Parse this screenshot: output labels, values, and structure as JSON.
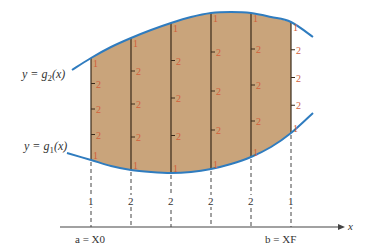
{
  "figure": {
    "colors": {
      "region_fill": "#c9a47b",
      "curve": "#2f7cbf",
      "weight_text": "#d2603a",
      "vertical_line": "#3a2a1a",
      "axis": "#444444",
      "label_text": "#333333"
    },
    "upper_curve_label": {
      "prefix": "y = g",
      "sub": "2",
      "suffix": "(x)"
    },
    "lower_curve_label": {
      "prefix": "y = g",
      "sub": "1",
      "suffix": "(x)"
    },
    "axis": {
      "x_label": "x",
      "left_label": "a = X0",
      "right_label": "b = XF"
    },
    "columns": [
      {
        "x": 91,
        "top": 58,
        "bottom": 160,
        "bottom_weight": "1",
        "weights": [
          "1",
          "2",
          "2",
          "2",
          "1"
        ]
      },
      {
        "x": 131,
        "top": 38,
        "bottom": 170,
        "bottom_weight": "2",
        "weights": [
          "1",
          "2",
          "2",
          "2",
          "1"
        ]
      },
      {
        "x": 171,
        "top": 23,
        "bottom": 173,
        "bottom_weight": "2",
        "weights": [
          "1",
          "2",
          "2",
          "2",
          "1"
        ]
      },
      {
        "x": 211,
        "top": 13,
        "bottom": 169,
        "bottom_weight": "2",
        "weights": [
          "1",
          "2",
          "2",
          "2",
          "1"
        ]
      },
      {
        "x": 251,
        "top": 13,
        "bottom": 157,
        "bottom_weight": "2",
        "weights": [
          "1",
          "2",
          "2",
          "2",
          "1"
        ]
      },
      {
        "x": 291,
        "top": 22,
        "bottom": 133,
        "bottom_weight": "1",
        "weights": [
          "1",
          "2",
          "2",
          "2",
          "1"
        ]
      }
    ],
    "upper_curve_points": [
      [
        72,
        70
      ],
      [
        91,
        58
      ],
      [
        111,
        47
      ],
      [
        131,
        38
      ],
      [
        151,
        30
      ],
      [
        171,
        23
      ],
      [
        191,
        17
      ],
      [
        211,
        13
      ],
      [
        231,
        12
      ],
      [
        251,
        13
      ],
      [
        271,
        17
      ],
      [
        291,
        22
      ],
      [
        313,
        37
      ]
    ],
    "lower_curve_points": [
      [
        67,
        153
      ],
      [
        91,
        160
      ],
      [
        111,
        166
      ],
      [
        131,
        170
      ],
      [
        151,
        172
      ],
      [
        171,
        173
      ],
      [
        191,
        172
      ],
      [
        211,
        169
      ],
      [
        231,
        164
      ],
      [
        251,
        157
      ],
      [
        271,
        147
      ],
      [
        291,
        133
      ],
      [
        313,
        113
      ]
    ]
  }
}
